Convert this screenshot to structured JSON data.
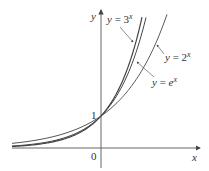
{
  "chart_data": {
    "type": "line",
    "title": "",
    "xlabel": "x",
    "ylabel": "y",
    "origin_label": "0",
    "y_tick_label": "1",
    "series": [
      {
        "name": "y = 3^x",
        "base": 3,
        "label": "y = 3",
        "exp": "x"
      },
      {
        "name": "y = e^x",
        "base": 2.718281828,
        "label": "y = e",
        "exp": "x"
      },
      {
        "name": "y = 2^x",
        "base": 2,
        "label": "y = 2",
        "exp": "x"
      }
    ],
    "xlim": [
      -2.8,
      3.0
    ],
    "ylim": [
      -0.6,
      4.6
    ],
    "grid": false,
    "legend": "inline annotations with arrows"
  },
  "colors": {
    "curve": "#444444",
    "axis": "#555555",
    "text": "#333333"
  }
}
